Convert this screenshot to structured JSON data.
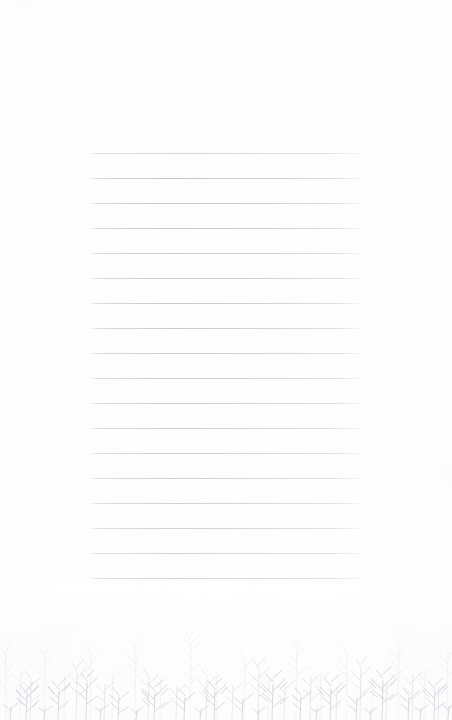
{
  "document": {
    "kind": "stationery-sheet",
    "title": "Blank Lined Stationery",
    "width": 452,
    "height": 720,
    "background_color": "#ffffff",
    "visible_text": ""
  },
  "paper": {
    "name": "paper-background",
    "color": "#ffffff",
    "tone_edge_color": "#fbfbfc"
  },
  "ruling": {
    "name": "ruled-lines",
    "line_color": "#b0b4bc",
    "line_count": 18,
    "left": 88,
    "right": 368,
    "width": 280,
    "first_line_y": 153,
    "line_spacing": 25,
    "last_line_y": 578,
    "line_thickness": 1
  },
  "illustration": {
    "name": "winter-forest-border",
    "description": "Faint bare-branched winter trees along the bottom edge",
    "stroke_color": "#c3c9d2",
    "back_color": "#dfe3e8",
    "mid_color": "#d2d7de",
    "top": 585,
    "height": 135,
    "tree_count": 26
  }
}
